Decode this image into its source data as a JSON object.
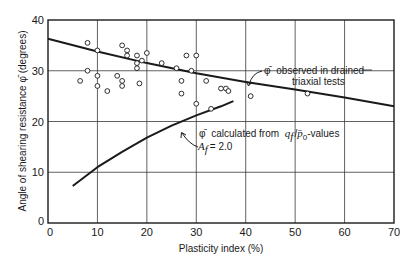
{
  "chart_data": {
    "type": "scatter",
    "title": "",
    "xlabel": "Plasticity index (%)",
    "ylabel": "Angle of shearing resistance φ̄ (degrees)",
    "xlim": [
      0,
      70
    ],
    "ylim": [
      0,
      40
    ],
    "x_ticks": [
      0,
      10,
      20,
      30,
      40,
      50,
      60,
      70
    ],
    "y_ticks": [
      0,
      10,
      20,
      30,
      40
    ],
    "grid": true,
    "legend": null,
    "series": [
      {
        "name": "Observed (drained triaxial tests) data points",
        "type": "scatter",
        "marker": "open-circle",
        "points": [
          [
            6.5,
            28.0
          ],
          [
            8.0,
            35.5
          ],
          [
            8.0,
            30.0
          ],
          [
            10.0,
            34.0
          ],
          [
            10.0,
            29.0
          ],
          [
            10.0,
            27.0
          ],
          [
            12.0,
            26.0
          ],
          [
            14.0,
            29.0
          ],
          [
            15.0,
            35.0
          ],
          [
            15.0,
            28.0
          ],
          [
            15.0,
            27.0
          ],
          [
            16.0,
            34.0
          ],
          [
            16.0,
            33.0
          ],
          [
            18.0,
            33.0
          ],
          [
            18.0,
            31.5
          ],
          [
            18.0,
            30.5
          ],
          [
            18.5,
            27.5
          ],
          [
            19.0,
            32.0
          ],
          [
            20.0,
            33.5
          ],
          [
            23.0,
            31.5
          ],
          [
            26.0,
            30.5
          ],
          [
            27.0,
            28.0
          ],
          [
            27.0,
            25.5
          ],
          [
            28.0,
            33.0
          ],
          [
            29.0,
            30.0
          ],
          [
            30.0,
            33.0
          ],
          [
            30.0,
            23.5
          ],
          [
            32.0,
            28.0
          ],
          [
            33.0,
            22.5
          ],
          [
            35.0,
            26.5
          ],
          [
            36.0,
            26.5
          ],
          [
            36.5,
            26.0
          ],
          [
            41.0,
            25.0
          ],
          [
            52.5,
            25.5
          ]
        ]
      },
      {
        "name": "φ̄ observed in drained triaxial tests",
        "type": "line",
        "x": [
          0,
          10,
          20,
          30,
          40,
          50,
          60,
          70
        ],
        "values": [
          36.3,
          33.8,
          31.5,
          29.5,
          27.8,
          26.3,
          24.7,
          23.0
        ]
      },
      {
        "name": "φ̄ calculated from q_f/p̄_0-values, A_f = 2.0",
        "type": "line",
        "x": [
          5,
          10,
          15,
          20,
          25,
          30,
          35,
          37.5
        ],
        "values": [
          7.3,
          11.0,
          14.0,
          16.8,
          19.2,
          21.2,
          23.0,
          24.0
        ]
      }
    ],
    "annotations": [
      {
        "text": "φ̄ observed in drained triaxial tests",
        "line1": "observed in drained",
        "line2": "triaxial tests",
        "symbol": "φ̄",
        "arrow_to": [
          40,
          27.9
        ]
      },
      {
        "text": "φ̄ calculated from q_f/p̄_0-values",
        "symbol": "φ̄",
        "line1": "calculated from",
        "q_term": "q",
        "q_sub": "f",
        "slash": "/",
        "p_term": "p̄",
        "p_sub": "0",
        "tail": "-values",
        "line2_label": "A",
        "line2_sub": "f",
        "line2_value": "= 2.0",
        "arrow_to": [
          25,
          19.2
        ]
      }
    ]
  },
  "axes": {
    "x_label": "Plasticity index (%)",
    "y_label": "Angle of shearing resistance φ̄ (degrees)",
    "x_tick_labels": [
      "0",
      "10",
      "20",
      "30",
      "40",
      "50",
      "60",
      "70"
    ],
    "y_tick_labels": [
      "0",
      "10",
      "20",
      "30",
      "40"
    ]
  },
  "colors": {
    "ink": "#1a1a1a",
    "grid": "#3a3a3a",
    "background": "#ffffff"
  }
}
